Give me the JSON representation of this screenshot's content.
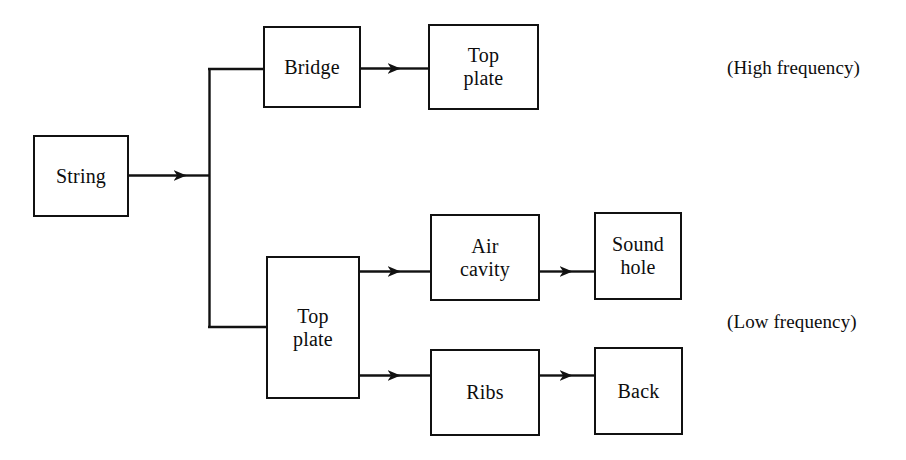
{
  "diagram": {
    "canvas": {
      "width": 906,
      "height": 460,
      "background": "#ffffff"
    },
    "style": {
      "line_color": "#111111",
      "box_border_color": "#111111",
      "box_fill": "#ffffff",
      "text_color": "#0d0d0d",
      "line_width": 2
    },
    "nodes": [
      {
        "id": "string",
        "label": "String",
        "x": 33,
        "y": 135,
        "w": 96,
        "h": 82
      },
      {
        "id": "bridge",
        "label": "Bridge",
        "x": 263,
        "y": 26,
        "w": 98,
        "h": 82
      },
      {
        "id": "top_plate_hi",
        "label": "Top\nplate",
        "x": 428,
        "y": 24,
        "w": 111,
        "h": 86
      },
      {
        "id": "top_plate_lo",
        "label": "Top\nplate",
        "x": 266,
        "y": 256,
        "w": 94,
        "h": 143
      },
      {
        "id": "air_cavity",
        "label": "Air\ncavity",
        "x": 430,
        "y": 214,
        "w": 110,
        "h": 87
      },
      {
        "id": "sound_hole",
        "label": "Sound\nhole",
        "x": 594,
        "y": 212,
        "w": 88,
        "h": 88
      },
      {
        "id": "ribs",
        "label": "Ribs",
        "x": 430,
        "y": 349,
        "w": 110,
        "h": 87
      },
      {
        "id": "back",
        "label": "Back",
        "x": 594,
        "y": 347,
        "w": 89,
        "h": 88
      }
    ],
    "edges": [
      {
        "id": "string-to-junction",
        "from": "string",
        "to": "junction",
        "arrow": true
      },
      {
        "id": "junction-to-bridge",
        "from": "junction",
        "to": "bridge",
        "arrow": false
      },
      {
        "id": "bridge-to-top-plate-high",
        "from": "bridge",
        "to": "top_plate_hi",
        "arrow": true
      },
      {
        "id": "junction-to-top-plate-low",
        "from": "junction",
        "to": "top_plate_lo",
        "arrow": false
      },
      {
        "id": "top-plate-low-to-air-cavity",
        "from": "top_plate_lo",
        "to": "air_cavity",
        "arrow": true
      },
      {
        "id": "air-cavity-to-sound-hole",
        "from": "air_cavity",
        "to": "sound_hole",
        "arrow": true
      },
      {
        "id": "top-plate-low-to-ribs",
        "from": "top_plate_lo",
        "to": "ribs",
        "arrow": true
      },
      {
        "id": "ribs-to-back",
        "from": "ribs",
        "to": "back",
        "arrow": true
      }
    ],
    "annotations": [
      {
        "id": "high_frequency",
        "label": "(High frequency)",
        "x": 727,
        "y": 57
      },
      {
        "id": "low_frequency",
        "label": "(Low frequency)",
        "x": 727,
        "y": 311
      }
    ]
  }
}
